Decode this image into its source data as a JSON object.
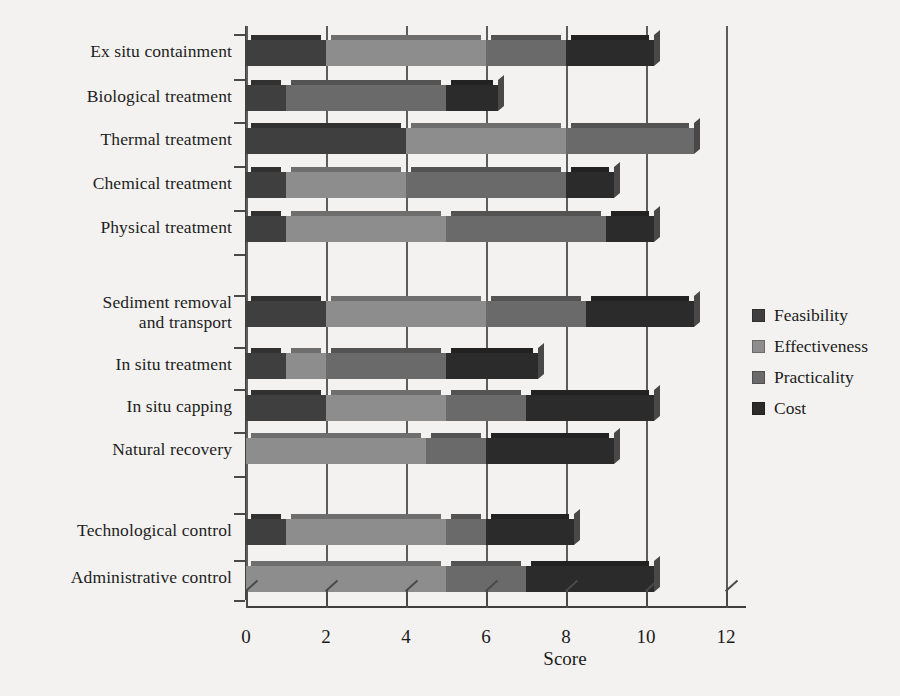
{
  "chart_data": {
    "type": "bar",
    "orientation": "horizontal",
    "stacked": true,
    "title": "",
    "xlabel": "Score",
    "ylabel": "",
    "xlim": [
      0,
      12
    ],
    "xticks": [
      0,
      2,
      4,
      6,
      8,
      10,
      12
    ],
    "grid": true,
    "legend_position": "right",
    "categories": [
      "Ex situ containment",
      "Biological treatment",
      "Thermal treatment",
      "Chemical treatment",
      "Physical treatment",
      "Sediment removal\nand transport",
      "In situ treatment",
      "In situ capping",
      "Natural recovery",
      "Technological control",
      "Administrative control"
    ],
    "series": [
      {
        "name": "Feasibility",
        "color": "#3f3f3f",
        "values": [
          2.0,
          1.0,
          4.0,
          1.0,
          1.0,
          2.0,
          1.0,
          2.0,
          0.0,
          1.0,
          0.0
        ]
      },
      {
        "name": "Effectiveness",
        "color": "#8d8d8d",
        "values": [
          4.0,
          0.0,
          4.0,
          3.0,
          4.0,
          4.0,
          1.0,
          3.0,
          4.5,
          4.0,
          5.0
        ]
      },
      {
        "name": "Practicality",
        "color": "#6a6a6a",
        "values": [
          2.0,
          4.0,
          3.2,
          4.0,
          4.0,
          2.5,
          3.0,
          2.0,
          1.5,
          1.0,
          2.0
        ]
      },
      {
        "name": "Cost",
        "color": "#2b2b2b",
        "values": [
          2.2,
          1.3,
          0.0,
          1.2,
          1.2,
          2.7,
          2.3,
          3.2,
          3.2,
          2.2,
          3.2
        ]
      }
    ],
    "totals": [
      10.2,
      6.3,
      11.2,
      9.2,
      10.2,
      11.2,
      7.3,
      10.2,
      9.2,
      8.2,
      10.2
    ],
    "group_gaps_after": [
      4,
      8
    ]
  },
  "legend": {
    "items": [
      {
        "label": "Feasibility",
        "color": "#3f3f3f"
      },
      {
        "label": "Effectiveness",
        "color": "#8d8d8d"
      },
      {
        "label": "Practicality",
        "color": "#6a6a6a"
      },
      {
        "label": "Cost",
        "color": "#2b2b2b"
      }
    ]
  }
}
